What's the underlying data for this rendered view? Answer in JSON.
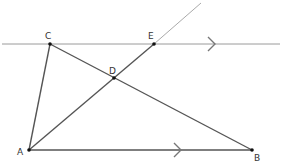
{
  "diagram": {
    "type": "geometry",
    "points": {
      "A": {
        "label": "A",
        "x": 29,
        "y": 150
      },
      "B": {
        "label": "B",
        "x": 252,
        "y": 150
      },
      "C": {
        "label": "C",
        "x": 50,
        "y": 44
      },
      "D": {
        "label": "D",
        "x": 114,
        "y": 78
      },
      "E": {
        "label": "E",
        "x": 154,
        "y": 44
      }
    },
    "segments": [
      "AB",
      "AC",
      "CB",
      "AE"
    ],
    "parallel_lines": [
      "CE",
      "AB"
    ],
    "parallel_marker": ">",
    "colors": {
      "line": "#555555",
      "thin_line": "#999999",
      "point": "#111111"
    }
  }
}
